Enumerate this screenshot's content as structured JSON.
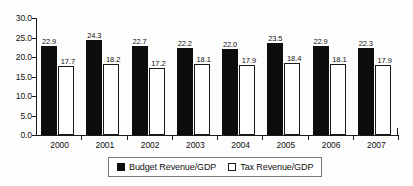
{
  "chart_data": {
    "type": "bar",
    "title": "",
    "subtitle": "",
    "xlabel": "",
    "ylabel": "",
    "categories": [
      "2000",
      "2001",
      "2002",
      "2003",
      "2004",
      "2005",
      "2006",
      "2007"
    ],
    "series": [
      {
        "name": "Budget Revenue/GDP",
        "marker": "filled-square",
        "color": "#0d0d0d",
        "values": [
          22.9,
          24.3,
          22.7,
          22.2,
          22.0,
          23.5,
          22.9,
          22.3
        ],
        "labels": [
          "22.9",
          "24.3",
          "22.7",
          "22.2",
          "22.0",
          "23.5",
          "22.9",
          "22.3"
        ]
      },
      {
        "name": "Tax Revenue/GDP",
        "marker": "hollow-square",
        "color": "#ffffff",
        "values": [
          17.7,
          18.2,
          17.2,
          18.1,
          17.9,
          18.4,
          18.1,
          17.9
        ],
        "labels": [
          "17.7",
          "18.2",
          "17.2",
          "18.1",
          "17.9",
          "18.4",
          "18.1",
          "17.9"
        ]
      }
    ],
    "ylim": [
      0.0,
      30.0
    ],
    "ytick_step": 5.0,
    "ytick_labels": [
      "30.0",
      "25.0",
      "20.0",
      "15.0",
      "10.0",
      "5.0",
      "0.0"
    ],
    "ytick_values": [
      30.0,
      25.0,
      20.0,
      15.0,
      10.0,
      5.0,
      0.0
    ],
    "grid": false,
    "legend_position": "bottom-center",
    "data_labels": true
  }
}
